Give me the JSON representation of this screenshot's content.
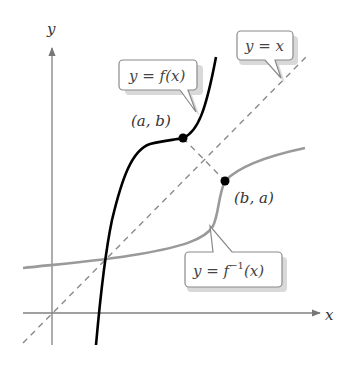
{
  "diagram": {
    "axes": {
      "x_label": "x",
      "y_label": "y",
      "color": "#777777"
    },
    "curves": [
      {
        "name": "f",
        "label": "y = f(x)",
        "color": "#000000",
        "style": "solid"
      },
      {
        "name": "f_inverse",
        "label_main": "y = f",
        "label_sup": "−1",
        "label_tail": "(x)",
        "color": "#999999",
        "style": "solid"
      },
      {
        "name": "identity",
        "label": "y = x",
        "color": "#888888",
        "style": "dashed"
      }
    ],
    "points": [
      {
        "label": "(a, b)",
        "on": "f"
      },
      {
        "label": "(b, a)",
        "on": "f_inverse"
      }
    ],
    "callouts": {
      "f": "y = f(x)",
      "identity": "y = x",
      "f_inverse_main": "y = f",
      "f_inverse_sup": "−1",
      "f_inverse_tail": "(x)"
    }
  }
}
